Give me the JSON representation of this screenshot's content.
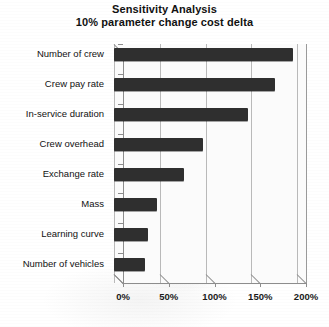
{
  "chart_data": {
    "type": "bar",
    "orientation": "horizontal",
    "title": "Sensitivity Analysis",
    "subtitle": "10% parameter change cost delta",
    "xlabel": "",
    "ylabel": "",
    "categories": [
      "Number of crew",
      "Crew pay rate",
      "In-service duration",
      "Crew overhead",
      "Exchange rate",
      "Mass",
      "Learning curve",
      "Number of vehicles"
    ],
    "values": [
      196,
      176,
      146,
      97,
      76,
      47,
      37,
      34
    ],
    "value_unit": "%",
    "xlim": [
      0,
      200
    ],
    "xticks": [
      0,
      50,
      100,
      150,
      200
    ],
    "xtick_labels": [
      "0%",
      "50%",
      "100%",
      "150%",
      "200%"
    ],
    "grid": "vertical",
    "legend": "none",
    "bar_color": "#2f2f2f",
    "gridline_color": "#b9b9b9",
    "axis_color": "#8d8d8d",
    "plot_background": "#fbfbfb"
  }
}
